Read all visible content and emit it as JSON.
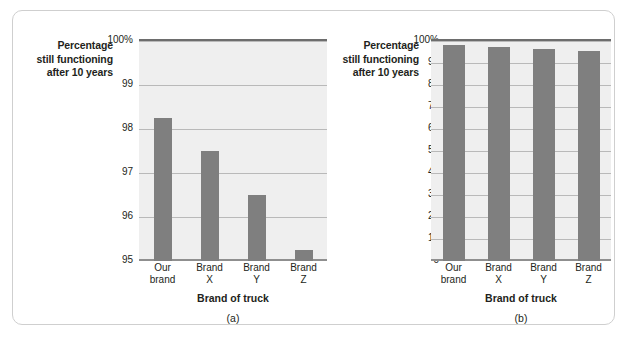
{
  "figure": {
    "panels": [
      {
        "caption": "(a)",
        "ylabel_lines": [
          "Percentage",
          "still functioning",
          "after 10 years"
        ],
        "xlabel": "Brand of truck",
        "chart_data": {
          "type": "bar",
          "title": "",
          "xlabel": "Brand of truck",
          "ylabel": "Percentage still functioning after 10 years",
          "categories": [
            "Our brand",
            "Brand X",
            "Brand Y",
            "Brand Z"
          ],
          "category_lines": [
            [
              "Our",
              "brand"
            ],
            [
              "Brand",
              "X"
            ],
            [
              "Brand",
              "Y"
            ],
            [
              "Brand",
              "Z"
            ]
          ],
          "values": [
            98.25,
            97.5,
            96.5,
            95.25
          ],
          "ylim": [
            95,
            100
          ],
          "yticks": [
            95,
            96,
            97,
            98,
            99,
            100
          ],
          "ytick_labels": [
            "95",
            "96",
            "97",
            "98",
            "99",
            "100%"
          ],
          "grid": true,
          "legend": "none",
          "bar_color": "#7f7f7f",
          "plot_bg": "#efefef"
        }
      },
      {
        "caption": "(b)",
        "ylabel_lines": [
          "Percentage",
          "still functioning",
          "after 10 years"
        ],
        "xlabel": "Brand of truck",
        "chart_data": {
          "type": "bar",
          "title": "",
          "xlabel": "Brand of truck",
          "ylabel": "Percentage still functioning after 10 years",
          "categories": [
            "Our brand",
            "Brand X",
            "Brand Y",
            "Brand Z"
          ],
          "category_lines": [
            [
              "Our",
              "brand"
            ],
            [
              "Brand",
              "X"
            ],
            [
              "Brand",
              "Y"
            ],
            [
              "Brand",
              "Z"
            ]
          ],
          "values": [
            98.25,
            97.5,
            96.5,
            95.25
          ],
          "ylim": [
            0,
            100
          ],
          "yticks": [
            0,
            10,
            20,
            30,
            40,
            50,
            60,
            70,
            80,
            90,
            100
          ],
          "ytick_labels": [
            "0",
            "10",
            "20",
            "30",
            "40",
            "50",
            "60",
            "70",
            "80",
            "90",
            "100%"
          ],
          "grid": true,
          "legend": "none",
          "bar_color": "#7f7f7f",
          "plot_bg": "#efefef"
        }
      }
    ]
  }
}
